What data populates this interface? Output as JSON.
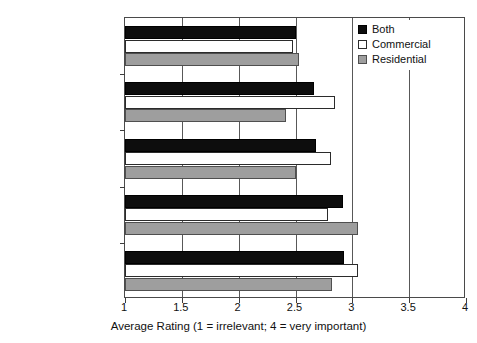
{
  "chart_data": {
    "type": "bar",
    "orientation": "horizontal",
    "title": "",
    "xlabel": "Average Rating (1 = irrelevant; 4 = very important)",
    "ylabel": "",
    "xlim": [
      1,
      4
    ],
    "xticks": [
      "1",
      "1.5",
      "2",
      "2.5",
      "3",
      "3.5",
      "4"
    ],
    "xtick_values": [
      1,
      1.5,
      2,
      2.5,
      3,
      3.5,
      4
    ],
    "grid": true,
    "grid_axis": "x",
    "legend_position": "top-right",
    "categories": [
      "Remediation",
      "Choice of materials",
      "Construction",
      "Masterplan/site layout",
      "Building design"
    ],
    "series": [
      {
        "name": "Both",
        "color": "#0d0d0d",
        "values": [
          2.5,
          2.66,
          2.68,
          2.92,
          2.93
        ]
      },
      {
        "name": "Commercial",
        "color": "#ffffff",
        "values": [
          2.48,
          2.85,
          2.81,
          2.79,
          3.05
        ]
      },
      {
        "name": "Residential",
        "color": "#9e9e9e",
        "values": [
          2.53,
          2.42,
          2.5,
          3.05,
          2.82
        ]
      }
    ]
  },
  "legend": {
    "items": [
      {
        "label": "Both",
        "swatch": "black-square-swatch"
      },
      {
        "label": "Commercial",
        "swatch": "white-square-swatch"
      },
      {
        "label": "Residential",
        "swatch": "gray-square-swatch"
      }
    ]
  },
  "axis": {
    "x_title": "Average Rating (1 = irrelevant; 4 = very important)",
    "x_tick_labels": [
      "1",
      "1.5",
      "2",
      "2.5",
      "3",
      "3.5",
      "4"
    ],
    "y_tick_labels": [
      "Remediation",
      "Choice of materials",
      "Construction",
      "Masterplan/site layout",
      "Building design"
    ]
  }
}
